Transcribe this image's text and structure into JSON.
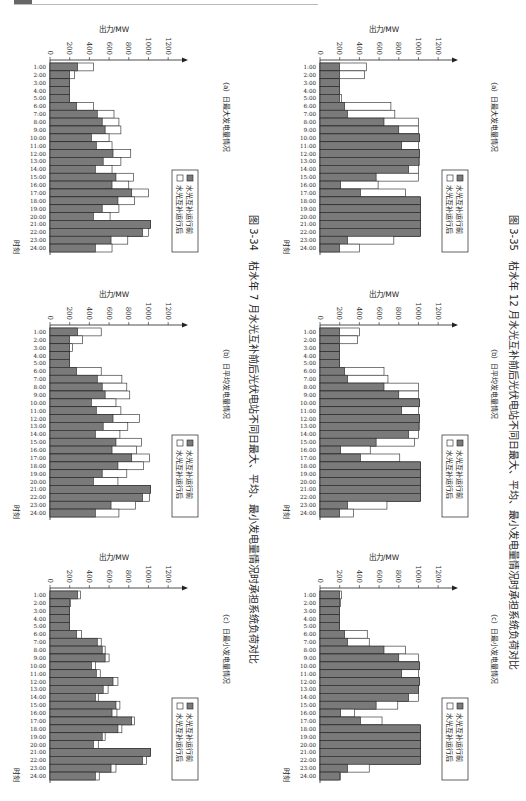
{
  "page": {
    "fig34_caption": "图 3-34　枯水年 7 月水光互补前后光伏电站不同日最大、平均、最小发电量情况时承担系统负荷对比",
    "fig35_caption": "图 3-35　枯水年 12 月水光互补前后光伏电站不同日最大、平均、最小发电量情况时承担系统负荷对比"
  },
  "colors": {
    "before": "#7a7a7a",
    "after": "#ffffff",
    "stroke": "#222222"
  },
  "chart_data": [
    {
      "id": "fig34a",
      "type": "bar",
      "figure": "图 3-34",
      "title": "（a）日最大发电量情况",
      "xlabel": "时刻",
      "ylabel": "出力/MW",
      "ylim": [
        0,
        1300
      ],
      "yticks": [
        0,
        200,
        400,
        600,
        800,
        1000,
        1200
      ],
      "legend": [
        "水光互补运行前",
        "水光互补运行后"
      ],
      "categories": [
        "1:00",
        "2:00",
        "3:00",
        "4:00",
        "5:00",
        "6:00",
        "7:00",
        "8:00",
        "9:00",
        "10:00",
        "11:00",
        "12:00",
        "13:00",
        "14:00",
        "15:00",
        "16:00",
        "17:00",
        "18:00",
        "19:00",
        "20:00",
        "21:00",
        "22:00",
        "23:00",
        "24:00"
      ],
      "series": [
        {
          "name": "水光互补运行前",
          "values": [
            280,
            200,
            200,
            200,
            200,
            270,
            480,
            530,
            560,
            420,
            470,
            640,
            540,
            460,
            670,
            630,
            830,
            690,
            530,
            440,
            1020,
            940,
            620,
            460
          ]
        },
        {
          "name": "水光互补运行后",
          "values": [
            440,
            250,
            200,
            200,
            200,
            440,
            650,
            700,
            720,
            600,
            630,
            820,
            720,
            630,
            850,
            800,
            1000,
            860,
            700,
            610,
            1020,
            1000,
            790,
            630
          ]
        }
      ]
    },
    {
      "id": "fig34b",
      "type": "bar",
      "figure": "图 3-34",
      "title": "（b）日平均发电量情况",
      "xlabel": "时刻",
      "ylabel": "出力/MW",
      "ylim": [
        0,
        1300
      ],
      "yticks": [
        0,
        200,
        400,
        600,
        800,
        1000,
        1200
      ],
      "legend": [
        "水光互补运行前",
        "水光互补运行后"
      ],
      "categories": [
        "1:00",
        "2:00",
        "3:00",
        "4:00",
        "5:00",
        "6:00",
        "7:00",
        "8:00",
        "9:00",
        "10:00",
        "11:00",
        "12:00",
        "13:00",
        "14:00",
        "15:00",
        "16:00",
        "17:00",
        "18:00",
        "19:00",
        "20:00",
        "21:00",
        "22:00",
        "23:00",
        "24:00"
      ],
      "series": [
        {
          "name": "水光互补运行前",
          "values": [
            280,
            200,
            200,
            200,
            200,
            270,
            480,
            530,
            560,
            420,
            470,
            640,
            540,
            460,
            670,
            630,
            830,
            690,
            530,
            440,
            1020,
            940,
            620,
            460
          ]
        },
        {
          "name": "水光互补运行后",
          "values": [
            520,
            330,
            230,
            200,
            200,
            520,
            730,
            780,
            810,
            670,
            720,
            910,
            790,
            710,
            930,
            880,
            1010,
            950,
            780,
            690,
            1020,
            1010,
            870,
            700
          ]
        }
      ]
    },
    {
      "id": "fig34c",
      "type": "bar",
      "figure": "图 3-34",
      "title": "（c）日最小发电量情况",
      "xlabel": "时刻",
      "ylabel": "出力/MW",
      "ylim": [
        0,
        1300
      ],
      "yticks": [
        0,
        200,
        400,
        600,
        800,
        1000,
        1200
      ],
      "legend": [
        "水光互补运行前",
        "水光互补运行后"
      ],
      "categories": [
        "1:00",
        "2:00",
        "3:00",
        "4:00",
        "5:00",
        "6:00",
        "7:00",
        "8:00",
        "9:00",
        "10:00",
        "11:00",
        "12:00",
        "13:00",
        "14:00",
        "15:00",
        "16:00",
        "17:00",
        "18:00",
        "19:00",
        "20:00",
        "21:00",
        "22:00",
        "23:00",
        "24:00"
      ],
      "series": [
        {
          "name": "水光互补运行前",
          "values": [
            280,
            200,
            200,
            200,
            200,
            270,
            480,
            530,
            560,
            420,
            470,
            640,
            540,
            460,
            670,
            630,
            830,
            690,
            530,
            440,
            1020,
            940,
            620,
            460
          ]
        },
        {
          "name": "水光互补运行后",
          "values": [
            310,
            210,
            200,
            200,
            200,
            320,
            520,
            560,
            600,
            460,
            510,
            690,
            590,
            490,
            710,
            680,
            860,
            730,
            560,
            490,
            1020,
            980,
            670,
            500
          ]
        }
      ]
    },
    {
      "id": "fig35a",
      "type": "bar",
      "figure": "图 3-35",
      "title": "（a）日最大发电量情况",
      "xlabel": "时刻",
      "ylabel": "出力/MW",
      "ylim": [
        0,
        1300
      ],
      "yticks": [
        0,
        200,
        400,
        600,
        800,
        1000,
        1200
      ],
      "legend": [
        "水光互补运行前",
        "水光互补运行后"
      ],
      "categories": [
        "1:00",
        "2:00",
        "3:00",
        "4:00",
        "5:00",
        "6:00",
        "7:00",
        "8:00",
        "9:00",
        "10:00",
        "11:00",
        "12:00",
        "13:00",
        "14:00",
        "15:00",
        "16:00",
        "17:00",
        "18:00",
        "19:00",
        "20:00",
        "21:00",
        "22:00",
        "23:00",
        "24:00"
      ],
      "series": [
        {
          "name": "水光互补运行前",
          "values": [
            200,
            200,
            200,
            200,
            200,
            250,
            280,
            650,
            800,
            1010,
            830,
            1010,
            1000,
            900,
            570,
            210,
            410,
            1020,
            1020,
            1020,
            1020,
            1020,
            280,
            200
          ]
        },
        {
          "name": "水光互补运行后",
          "values": [
            470,
            450,
            200,
            200,
            220,
            720,
            760,
            1000,
            1000,
            1010,
            1000,
            1010,
            1010,
            1000,
            1000,
            590,
            870,
            1020,
            1020,
            1020,
            1020,
            1020,
            750,
            400
          ]
        }
      ]
    },
    {
      "id": "fig35b",
      "type": "bar",
      "figure": "图 3-35",
      "title": "（b）日平均发电量情况",
      "xlabel": "时刻",
      "ylabel": "出力/MW",
      "ylim": [
        0,
        1300
      ],
      "yticks": [
        0,
        200,
        400,
        600,
        800,
        1000,
        1200
      ],
      "legend": [
        "水光互补运行前",
        "水光互补运行后"
      ],
      "categories": [
        "1:00",
        "2:00",
        "3:00",
        "4:00",
        "5:00",
        "6:00",
        "7:00",
        "8:00",
        "9:00",
        "10:00",
        "11:00",
        "12:00",
        "13:00",
        "14:00",
        "15:00",
        "16:00",
        "17:00",
        "18:00",
        "19:00",
        "20:00",
        "21:00",
        "22:00",
        "23:00",
        "24:00"
      ],
      "series": [
        {
          "name": "水光互补运行前",
          "values": [
            200,
            200,
            200,
            200,
            200,
            250,
            280,
            650,
            800,
            1010,
            830,
            1010,
            1000,
            900,
            570,
            210,
            410,
            1020,
            1020,
            1020,
            1020,
            1020,
            280,
            200
          ]
        },
        {
          "name": "水光互补运行后",
          "values": [
            400,
            380,
            200,
            200,
            200,
            650,
            690,
            1000,
            1000,
            1010,
            1000,
            1010,
            1010,
            1000,
            960,
            510,
            810,
            1020,
            1020,
            1020,
            1020,
            1020,
            680,
            340
          ]
        }
      ]
    },
    {
      "id": "fig35c",
      "type": "bar",
      "figure": "图 3-35",
      "title": "（c）日最小发电量情况",
      "xlabel": "时刻",
      "ylabel": "出力/MW",
      "ylim": [
        0,
        1300
      ],
      "yticks": [
        0,
        200,
        400,
        600,
        800,
        1000,
        1200
      ],
      "legend": [
        "水光互补运行前",
        "水光互补运行后"
      ],
      "categories": [
        "1:00",
        "2:00",
        "3:00",
        "4:00",
        "5:00",
        "6:00",
        "7:00",
        "8:00",
        "9:00",
        "10:00",
        "11:00",
        "12:00",
        "13:00",
        "14:00",
        "15:00",
        "16:00",
        "17:00",
        "18:00",
        "19:00",
        "20:00",
        "21:00",
        "22:00",
        "23:00",
        "24:00"
      ],
      "series": [
        {
          "name": "水光互补运行前",
          "values": [
            200,
            200,
            200,
            200,
            200,
            250,
            280,
            650,
            800,
            1010,
            830,
            1010,
            1000,
            900,
            570,
            210,
            410,
            1020,
            1020,
            1020,
            1020,
            1020,
            280,
            200
          ]
        },
        {
          "name": "水光互补运行后",
          "values": [
            220,
            210,
            200,
            200,
            200,
            480,
            500,
            870,
            1000,
            1010,
            1000,
            1010,
            1000,
            1000,
            790,
            350,
            630,
            1020,
            1020,
            1020,
            1020,
            1020,
            500,
            210
          ]
        }
      ]
    }
  ]
}
